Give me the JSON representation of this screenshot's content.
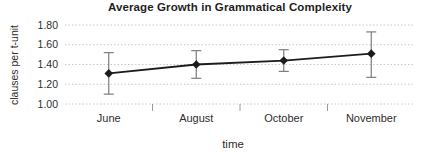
{
  "chart_data": {
    "type": "line",
    "title": "Average Growth in Grammatical Complexity",
    "xlabel": "time",
    "ylabel": "clauses per t-unit",
    "categories": [
      "June",
      "August",
      "October",
      "November"
    ],
    "values": [
      1.31,
      1.4,
      1.44,
      1.51
    ],
    "error_low": [
      1.1,
      1.26,
      1.33,
      1.27
    ],
    "error_high": [
      1.52,
      1.54,
      1.55,
      1.73
    ],
    "ylim": [
      1.0,
      1.8
    ],
    "yticks": [
      "1.80",
      "1.60",
      "1.40",
      "1.20",
      "1.00"
    ],
    "grid": true,
    "legend": "none",
    "marker_shape": "diamond",
    "colors": {
      "line": "#1c1c1c",
      "marker": "#1c1c1c",
      "error_bar": "#7d7d7d",
      "gridline": "#c8c8c8",
      "axis_tick": "#9a9a9a",
      "text": "#2e2e2e",
      "title": "#1f1f1f",
      "background": "#ffffff"
    }
  }
}
